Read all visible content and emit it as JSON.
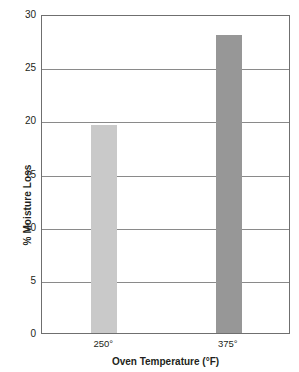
{
  "chart_data": {
    "type": "bar",
    "title": "",
    "subtitle": "",
    "xlabel": "Oven Temperature (°F)",
    "ylabel": "% Moisture Loss",
    "categories": [
      "250°",
      "375°"
    ],
    "values": [
      19.6,
      28.0
    ],
    "series": [
      {
        "name": "% Moisture Loss",
        "values": [
          19.6,
          28.0
        ]
      }
    ],
    "bar_colors": [
      "#c9c9c9",
      "#979797"
    ],
    "ylim": [
      0,
      30
    ],
    "yticks": [
      0,
      5,
      10,
      15,
      20,
      25,
      30
    ],
    "ytick_labels": [
      "0",
      "5",
      "10",
      "15",
      "20",
      "25",
      "30"
    ],
    "xtick_labels": [
      "250°",
      "375°"
    ],
    "grid": "horizontal",
    "legend": "none",
    "annotations": [],
    "frame_color": "#6f6f6f",
    "gridline_color": "#8a8a8a",
    "background": "#ffffff"
  },
  "axes": {
    "y_title": "% Moisture Loss",
    "x_title": "Oven Temperature (°F)"
  }
}
